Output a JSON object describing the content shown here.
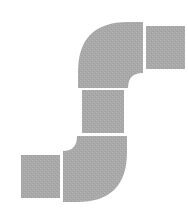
{
  "diagram": {
    "title": "",
    "fill_color": "#a9a9a9",
    "background_color": "#ffffff",
    "segments": [
      {
        "id": "right-straight",
        "type": "straight",
        "x": 146,
        "y": 26,
        "w": 39,
        "h": 43
      },
      {
        "id": "top-elbow",
        "type": "elbow",
        "orientation": "outer-top-left"
      },
      {
        "id": "middle-straight",
        "type": "straight",
        "x": 82,
        "y": 90,
        "w": 42,
        "h": 43
      },
      {
        "id": "bottom-elbow",
        "type": "elbow",
        "orientation": "outer-bottom-right"
      },
      {
        "id": "left-straight",
        "type": "straight",
        "x": 21,
        "y": 155,
        "w": 39,
        "h": 43
      }
    ]
  }
}
